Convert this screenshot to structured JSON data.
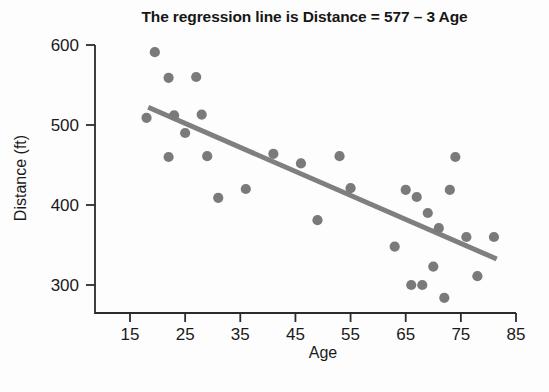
{
  "chart_data": {
    "type": "scatter",
    "title": "The regression line is Distance = 577 – 3 Age",
    "xlabel": "Age",
    "ylabel": "Distance (ft)",
    "xlim": [
      13,
      87
    ],
    "ylim": [
      272,
      608
    ],
    "xticks": [
      15,
      25,
      35,
      45,
      55,
      65,
      75,
      85
    ],
    "yticks": [
      300,
      400,
      500,
      600
    ],
    "grid": false,
    "legend": null,
    "marker_color": "#7a7a7a",
    "line_color": "#7f7f7f",
    "axis_color": "#2b2b2b",
    "points": [
      {
        "x": 19.5,
        "y": 591
      },
      {
        "x": 22,
        "y": 559
      },
      {
        "x": 27,
        "y": 560
      },
      {
        "x": 18,
        "y": 509
      },
      {
        "x": 23,
        "y": 512
      },
      {
        "x": 28,
        "y": 513
      },
      {
        "x": 25,
        "y": 490
      },
      {
        "x": 22,
        "y": 460
      },
      {
        "x": 29,
        "y": 461
      },
      {
        "x": 31,
        "y": 409
      },
      {
        "x": 36,
        "y": 420
      },
      {
        "x": 41,
        "y": 464
      },
      {
        "x": 46,
        "y": 452
      },
      {
        "x": 49,
        "y": 381
      },
      {
        "x": 53,
        "y": 461
      },
      {
        "x": 55,
        "y": 421
      },
      {
        "x": 63,
        "y": 348
      },
      {
        "x": 65,
        "y": 419
      },
      {
        "x": 66,
        "y": 300
      },
      {
        "x": 67,
        "y": 410
      },
      {
        "x": 68,
        "y": 300
      },
      {
        "x": 69,
        "y": 390
      },
      {
        "x": 70,
        "y": 323
      },
      {
        "x": 71,
        "y": 371
      },
      {
        "x": 72,
        "y": 284
      },
      {
        "x": 73,
        "y": 419
      },
      {
        "x": 74,
        "y": 460
      },
      {
        "x": 76,
        "y": 360
      },
      {
        "x": 78,
        "y": 311
      },
      {
        "x": 81,
        "y": 360
      }
    ],
    "regression_line": {
      "equation": "Distance = 577 – 3 Age",
      "intercept": 577,
      "slope": -3,
      "x_start": 18.3,
      "x_end": 81.5
    }
  }
}
